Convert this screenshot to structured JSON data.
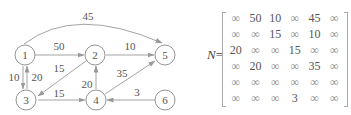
{
  "graph": {
    "nodes": [
      {
        "id": "1",
        "label": "1",
        "x": 25,
        "y": 55
      },
      {
        "id": "2",
        "label": "2",
        "x": 95,
        "y": 55
      },
      {
        "id": "3",
        "label": "3",
        "x": 28,
        "y": 100
      },
      {
        "id": "4",
        "label": "4",
        "x": 96,
        "y": 100
      },
      {
        "id": "5",
        "label": "5",
        "x": 165,
        "y": 55
      },
      {
        "id": "6",
        "label": "6",
        "x": 165,
        "y": 100
      }
    ],
    "edges": [
      {
        "from": "1",
        "to": "5",
        "weight": "45"
      },
      {
        "from": "1",
        "to": "2",
        "weight": "50"
      },
      {
        "from": "2",
        "to": "5",
        "weight": "10"
      },
      {
        "from": "2",
        "to": "3",
        "weight": "15"
      },
      {
        "from": "1",
        "to": "3",
        "weight": "10"
      },
      {
        "from": "3",
        "to": "1",
        "weight": "20"
      },
      {
        "from": "3",
        "to": "4",
        "weight": "15"
      },
      {
        "from": "4",
        "to": "2",
        "weight": "20"
      },
      {
        "from": "4",
        "to": "5",
        "weight": "35"
      },
      {
        "from": "6",
        "to": "4",
        "weight": "3"
      }
    ]
  },
  "matrix": {
    "name": "N",
    "equals": "=",
    "rows": [
      [
        "∞",
        "50",
        "10",
        "∞",
        "45",
        "∞"
      ],
      [
        "∞",
        "∞",
        "15",
        "∞",
        "10",
        "∞"
      ],
      [
        "20",
        "∞",
        "∞",
        "15",
        "∞",
        "∞"
      ],
      [
        "∞",
        "20",
        "∞",
        "∞",
        "35",
        "∞"
      ],
      [
        "∞",
        "∞",
        "∞",
        "∞",
        "∞",
        "∞"
      ],
      [
        "∞",
        "∞",
        "∞",
        "3",
        "∞",
        "∞"
      ]
    ]
  }
}
